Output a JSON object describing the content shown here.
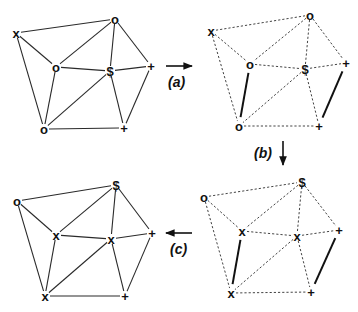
{
  "figure": {
    "edges_topology": [
      [
        "x",
        "oTop"
      ],
      [
        "x",
        "oMid"
      ],
      [
        "x",
        "oBot"
      ],
      [
        "oTop",
        "oMid"
      ],
      [
        "oTop",
        "S"
      ],
      [
        "oTop",
        "pR"
      ],
      [
        "oMid",
        "S"
      ],
      [
        "oMid",
        "oBot"
      ],
      [
        "S",
        "pR"
      ],
      [
        "S",
        "oBot"
      ],
      [
        "S",
        "pB"
      ],
      [
        "pR",
        "pB"
      ],
      [
        "oBot",
        "pB"
      ]
    ],
    "panels": [
      {
        "id": "top-left",
        "edge_style": "solid",
        "nodes": {
          "x": {
            "label": "x",
            "x": 16,
            "y": 33
          },
          "oTop": {
            "label": "o",
            "x": 115,
            "y": 19
          },
          "oMid": {
            "label": "o",
            "x": 56,
            "y": 67
          },
          "S": {
            "label": "$",
            "x": 110,
            "y": 71
          },
          "pR": {
            "label": "+",
            "x": 151,
            "y": 66
          },
          "oBot": {
            "label": "o",
            "x": 44,
            "y": 129
          },
          "pB": {
            "label": "+",
            "x": 124,
            "y": 128
          }
        },
        "bold_edges": []
      },
      {
        "id": "top-right",
        "edge_style": "dashed",
        "nodes": {
          "x": {
            "label": "x",
            "x": 211,
            "y": 31
          },
          "oTop": {
            "label": "o",
            "x": 310,
            "y": 15
          },
          "oMid": {
            "label": "o",
            "x": 250,
            "y": 64
          },
          "S": {
            "label": "$",
            "x": 305,
            "y": 69
          },
          "pR": {
            "label": "+",
            "x": 346,
            "y": 63
          },
          "oBot": {
            "label": "o",
            "x": 239,
            "y": 126
          },
          "pB": {
            "label": "+",
            "x": 319,
            "y": 126
          }
        },
        "bold_edges": [
          [
            "oMid",
            "oBot"
          ],
          [
            "pR",
            "pB"
          ]
        ]
      },
      {
        "id": "bottom-right",
        "edge_style": "dashed",
        "nodes": {
          "x": {
            "label": "o",
            "x": 204,
            "y": 197
          },
          "oTop": {
            "label": "$",
            "x": 302,
            "y": 182
          },
          "oMid": {
            "label": "x",
            "x": 242,
            "y": 231
          },
          "S": {
            "label": "x",
            "x": 297,
            "y": 236
          },
          "pR": {
            "label": "+",
            "x": 339,
            "y": 230
          },
          "oBot": {
            "label": "x",
            "x": 231,
            "y": 293
          },
          "pB": {
            "label": "+",
            "x": 311,
            "y": 292
          }
        },
        "bold_edges": [
          [
            "oMid",
            "oBot"
          ],
          [
            "pR",
            "pB"
          ]
        ]
      },
      {
        "id": "bottom-left",
        "edge_style": "solid",
        "nodes": {
          "x": {
            "label": "o",
            "x": 17,
            "y": 201
          },
          "oTop": {
            "label": "$",
            "x": 116,
            "y": 185
          },
          "oMid": {
            "label": "x",
            "x": 56,
            "y": 235
          },
          "S": {
            "label": "x",
            "x": 111,
            "y": 239
          },
          "pR": {
            "label": "+",
            "x": 152,
            "y": 233
          },
          "oBot": {
            "label": "x",
            "x": 45,
            "y": 296
          },
          "pB": {
            "label": "+",
            "x": 125,
            "y": 296
          }
        },
        "bold_edges": []
      }
    ],
    "arrows": [
      {
        "id": "a",
        "label": "(a)",
        "direction": "right",
        "x1": 166,
        "y1": 66,
        "x2": 192,
        "y2": 66,
        "label_x": 168,
        "label_y": 87
      },
      {
        "id": "b",
        "label": "(b)",
        "direction": "down",
        "x1": 283,
        "y1": 141,
        "x2": 283,
        "y2": 165,
        "label_x": 254,
        "label_y": 158
      },
      {
        "id": "c",
        "label": "(c)",
        "direction": "left",
        "x1": 192,
        "y1": 233,
        "x2": 166,
        "y2": 233,
        "label_x": 170,
        "label_y": 254
      }
    ]
  }
}
